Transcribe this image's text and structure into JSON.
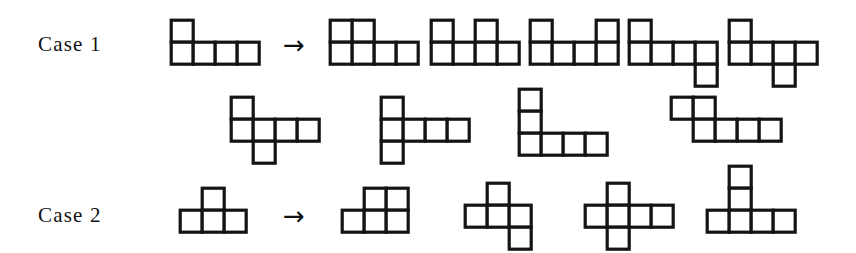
{
  "figure": {
    "background_color": "#ffffff",
    "ink_color": "#141414",
    "cell_size": 22,
    "stroke_width": 3.2
  },
  "rows": [
    {
      "name": "case-1",
      "label": "Case 1",
      "label_pos": {
        "x": 38,
        "y": 32
      },
      "arrow": {
        "glyph": "→",
        "x": 283,
        "y": 32
      },
      "source": {
        "name": "case-1-source-polyomino",
        "x": 168,
        "y": 17,
        "cells": [
          [
            0,
            0
          ],
          [
            1,
            0
          ],
          [
            1,
            1
          ],
          [
            1,
            2
          ],
          [
            1,
            3
          ]
        ]
      },
      "results": [
        {
          "name": "case-1-result-1",
          "x": 327,
          "y": 17,
          "cells": [
            [
              0,
              0
            ],
            [
              0,
              1
            ],
            [
              1,
              0
            ],
            [
              1,
              1
            ],
            [
              1,
              2
            ],
            [
              1,
              3
            ]
          ]
        },
        {
          "name": "case-1-result-2",
          "x": 428,
          "y": 17,
          "cells": [
            [
              0,
              0
            ],
            [
              0,
              2
            ],
            [
              1,
              0
            ],
            [
              1,
              1
            ],
            [
              1,
              2
            ],
            [
              1,
              3
            ]
          ]
        },
        {
          "name": "case-1-result-3",
          "x": 527,
          "y": 17,
          "cells": [
            [
              0,
              0
            ],
            [
              0,
              3
            ],
            [
              1,
              0
            ],
            [
              1,
              1
            ],
            [
              1,
              2
            ],
            [
              1,
              3
            ]
          ]
        },
        {
          "name": "case-1-result-4",
          "x": 626,
          "y": 17,
          "cells": [
            [
              0,
              0
            ],
            [
              1,
              0
            ],
            [
              1,
              1
            ],
            [
              1,
              2
            ],
            [
              1,
              3
            ],
            [
              2,
              3
            ]
          ]
        },
        {
          "name": "case-1-result-5",
          "x": 726,
          "y": 17,
          "cells": [
            [
              0,
              0
            ],
            [
              1,
              0
            ],
            [
              1,
              1
            ],
            [
              1,
              2
            ],
            [
              1,
              3
            ],
            [
              2,
              2
            ]
          ]
        },
        {
          "name": "case-1-result-6",
          "x": 228,
          "y": 94,
          "cells": [
            [
              0,
              0
            ],
            [
              1,
              0
            ],
            [
              1,
              1
            ],
            [
              1,
              2
            ],
            [
              1,
              3
            ],
            [
              2,
              1
            ]
          ]
        },
        {
          "name": "case-1-result-7",
          "x": 378,
          "y": 94,
          "cells": [
            [
              0,
              0
            ],
            [
              1,
              0
            ],
            [
              1,
              1
            ],
            [
              1,
              2
            ],
            [
              1,
              3
            ],
            [
              2,
              0
            ]
          ]
        },
        {
          "name": "case-1-result-8",
          "x": 516,
          "y": 86,
          "cells": [
            [
              0,
              0
            ],
            [
              1,
              0
            ],
            [
              2,
              0
            ],
            [
              2,
              1
            ],
            [
              2,
              2
            ],
            [
              2,
              3
            ]
          ]
        },
        {
          "name": "case-1-result-9",
          "x": 668,
          "y": 94,
          "cells": [
            [
              0,
              0
            ],
            [
              0,
              1
            ],
            [
              1,
              1
            ],
            [
              1,
              2
            ],
            [
              1,
              3
            ],
            [
              1,
              4
            ]
          ]
        }
      ]
    },
    {
      "name": "case-2",
      "label": "Case 2",
      "label_pos": {
        "x": 38,
        "y": 203
      },
      "arrow": {
        "glyph": "→",
        "x": 283,
        "y": 203
      },
      "source": {
        "name": "case-2-source-polyomino",
        "x": 177,
        "y": 185,
        "cells": [
          [
            0,
            1
          ],
          [
            1,
            0
          ],
          [
            1,
            1
          ],
          [
            1,
            2
          ]
        ]
      },
      "results": [
        {
          "name": "case-2-result-1",
          "x": 339,
          "y": 185,
          "cells": [
            [
              0,
              1
            ],
            [
              0,
              2
            ],
            [
              1,
              0
            ],
            [
              1,
              1
            ],
            [
              1,
              2
            ]
          ]
        },
        {
          "name": "case-2-result-2",
          "x": 462,
          "y": 180,
          "cells": [
            [
              0,
              1
            ],
            [
              1,
              0
            ],
            [
              1,
              1
            ],
            [
              1,
              2
            ],
            [
              2,
              2
            ]
          ]
        },
        {
          "name": "case-2-result-3",
          "x": 582,
          "y": 180,
          "cells": [
            [
              0,
              1
            ],
            [
              1,
              0
            ],
            [
              1,
              1
            ],
            [
              1,
              2
            ],
            [
              1,
              3
            ],
            [
              2,
              1
            ]
          ]
        },
        {
          "name": "case-2-result-4",
          "x": 704,
          "y": 163,
          "cells": [
            [
              0,
              1
            ],
            [
              1,
              1
            ],
            [
              2,
              0
            ],
            [
              2,
              1
            ],
            [
              2,
              2
            ],
            [
              2,
              3
            ]
          ]
        }
      ]
    }
  ]
}
